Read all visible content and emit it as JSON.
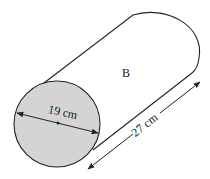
{
  "diagram": {
    "shape": "cylinder",
    "face_label": "B",
    "diameter_label": "19 cm",
    "length_label": "27 cm",
    "colors": {
      "stroke": "#222222",
      "face_fill": "#d4d4d4",
      "background": "#ffffff"
    }
  }
}
